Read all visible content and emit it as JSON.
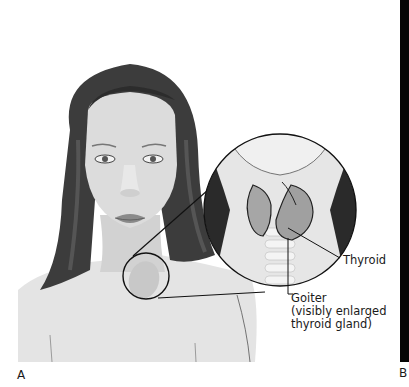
{
  "figure": {
    "panel_a_label": "A",
    "panel_b_label": "B",
    "labels": {
      "thyroid": "Thyroid",
      "goiter_line1": "Goiter",
      "goiter_line2": "(visibly enlarged",
      "goiter_line3": "thyroid gland)"
    },
    "colors": {
      "hair": "#3a3a3a",
      "skin": "#d8d8d8",
      "outline": "#111111",
      "background": "#ffffff",
      "thyroid": "#a8a8a8"
    }
  }
}
